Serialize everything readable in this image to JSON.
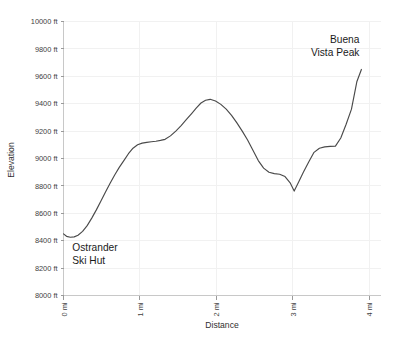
{
  "chart_data": {
    "type": "line",
    "title": "",
    "xlabel": "Distance",
    "ylabel": "Elevation",
    "xlim": [
      0,
      4.15
    ],
    "ylim": [
      8000,
      10000
    ],
    "grid": true,
    "legend": "none",
    "x_tick_labels": [
      "0 mi",
      "1 mi",
      "2 mi",
      "3 mi",
      "4 mi"
    ],
    "x_tick_values": [
      0,
      1,
      2,
      3,
      4
    ],
    "y_tick_labels": [
      "8000 ft",
      "8200 ft",
      "8400 ft",
      "8600 ft",
      "8800 ft",
      "9000 ft",
      "9200 ft",
      "9400 ft",
      "9600 ft",
      "9800 ft",
      "10000 ft"
    ],
    "y_tick_values": [
      8000,
      8200,
      8400,
      8600,
      8800,
      9000,
      9200,
      9400,
      9600,
      9800,
      10000
    ],
    "series_name": "Elevation profile",
    "line_color": "#4a4a4a",
    "x": [
      0.0,
      0.04,
      0.09,
      0.14,
      0.19,
      0.25,
      0.31,
      0.37,
      0.43,
      0.49,
      0.55,
      0.61,
      0.67,
      0.73,
      0.79,
      0.85,
      0.91,
      0.97,
      1.03,
      1.09,
      1.15,
      1.21,
      1.27,
      1.33,
      1.4,
      1.47,
      1.54,
      1.61,
      1.68,
      1.74,
      1.8,
      1.86,
      1.92,
      1.99,
      2.06,
      2.13,
      2.2,
      2.27,
      2.34,
      2.41,
      2.48,
      2.55,
      2.62,
      2.69,
      2.76,
      2.83,
      2.9,
      2.97,
      3.02,
      3.08,
      3.14,
      3.21,
      3.28,
      3.35,
      3.42,
      3.49,
      3.56,
      3.63,
      3.7,
      3.77,
      3.84,
      3.9
    ],
    "y": [
      8450,
      8432,
      8425,
      8428,
      8440,
      8468,
      8510,
      8565,
      8625,
      8690,
      8755,
      8820,
      8880,
      8935,
      8985,
      9035,
      9075,
      9100,
      9112,
      9118,
      9122,
      9126,
      9132,
      9140,
      9165,
      9200,
      9240,
      9285,
      9330,
      9370,
      9405,
      9425,
      9432,
      9420,
      9395,
      9360,
      9315,
      9260,
      9200,
      9135,
      9060,
      8985,
      8930,
      8900,
      8890,
      8885,
      8868,
      8820,
      8762,
      8830,
      8900,
      8975,
      9045,
      9075,
      9085,
      9088,
      9090,
      9150,
      9250,
      9360,
      9560,
      9650
    ],
    "annotations": [
      {
        "name": "ostrander-ski-hut",
        "lines": [
          "Ostrander",
          "Ski Hut"
        ],
        "anchor_x": 0.05,
        "anchor_y": 8430,
        "align": "left"
      },
      {
        "name": "buena-vista-peak",
        "lines": [
          "Buena",
          "Vista Peak"
        ],
        "anchor_x": 3.9,
        "anchor_y": 9650,
        "align": "right"
      }
    ]
  },
  "axes": {
    "x_title": "Distance",
    "y_title": "Elevation"
  },
  "annotation_labels": {
    "start_line1": "Ostrander",
    "start_line2": "Ski Hut",
    "end_line1": "Buena",
    "end_line2": "Vista Peak"
  }
}
